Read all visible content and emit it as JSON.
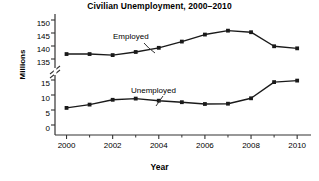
{
  "chart_data": {
    "type": "line",
    "title": "Civilian Unemployment, 2000–2010",
    "xlabel": "Year",
    "ylabel": "Millions",
    "grid": false,
    "legend_position": "inline-annotation",
    "axis_break": {
      "present": true,
      "between": [
        15,
        135
      ],
      "symbol": "double-slash"
    },
    "x": [
      2000,
      2001,
      2002,
      2003,
      2004,
      2005,
      2006,
      2007,
      2008,
      2009,
      2010
    ],
    "xtick_labels": [
      "2000",
      "2002",
      "2004",
      "2006",
      "2008",
      "2010"
    ],
    "xtick_values": [
      2000,
      2002,
      2004,
      2006,
      2008,
      2010
    ],
    "xminor_tick_values": [
      2001,
      2003,
      2005,
      2007,
      2009
    ],
    "xlim": [
      1999.5,
      2010.6
    ],
    "ytick_labels_upper": [
      "150",
      "145",
      "140",
      "135"
    ],
    "ytick_values_upper": [
      150,
      145,
      140,
      135
    ],
    "ytick_labels_lower": [
      "15",
      "10",
      "5",
      "0"
    ],
    "ytick_values_lower": [
      15,
      10,
      5,
      0
    ],
    "series": [
      {
        "name": "Employed",
        "values": [
          136.9,
          136.9,
          136.5,
          137.7,
          139.3,
          141.7,
          144.4,
          145.9,
          145.3,
          139.9,
          139.1
        ],
        "annotation_label": "Employed",
        "color": "#1a1a1a"
      },
      {
        "name": "Unemployed",
        "values": [
          5.7,
          6.8,
          8.4,
          8.8,
          8.1,
          7.6,
          7.0,
          7.1,
          8.9,
          14.3,
          14.8
        ],
        "annotation_label": "Unemployed",
        "color": "#1a1a1a"
      }
    ]
  },
  "style": {
    "line_color": "#1a1a1a",
    "axis_color": "#333333",
    "background": "#ffffff",
    "text_color": "#000000"
  }
}
